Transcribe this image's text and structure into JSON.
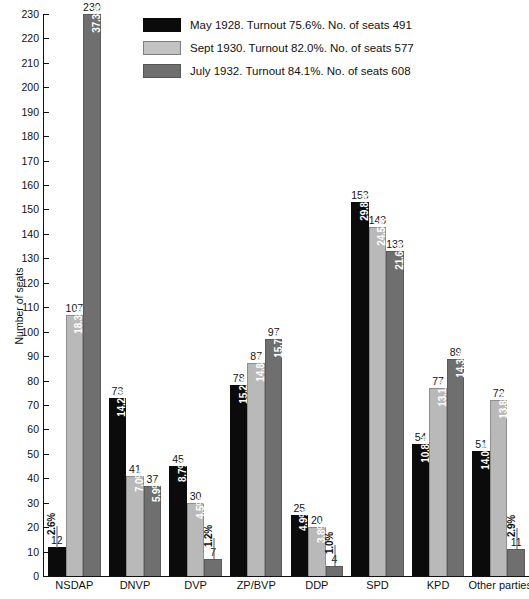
{
  "chart_data": {
    "type": "bar",
    "title": "",
    "xlabel": "",
    "ylabel": "Number of seats",
    "ylim": [
      0,
      230
    ],
    "ytick_step": 10,
    "grid": false,
    "legend_position": "top-center",
    "categories": [
      "NSDAP",
      "DNVP",
      "DVP",
      "ZP/BVP",
      "DDP",
      "SPD",
      "KPD",
      "Other parties"
    ],
    "series": [
      {
        "name": "May 1928. Turnout 75.6%. No. of seats 491",
        "short_name": "May 1928",
        "turnout": "75.6%",
        "total_seats": 491,
        "color": "#0b0b0b",
        "values": [
          12,
          73,
          45,
          78,
          25,
          153,
          54,
          51
        ],
        "percents": [
          "2.6%",
          "14.2%",
          "8.7%",
          "15.2%",
          "4.9%",
          "29.8%",
          "10.8%",
          "14.0%"
        ]
      },
      {
        "name": "Sept 1930. Turnout 82.0%. No. of seats 577",
        "short_name": "Sept 1930",
        "turnout": "82.0%",
        "total_seats": 577,
        "color": "#b9b9b9",
        "values": [
          107,
          41,
          30,
          87,
          20,
          143,
          77,
          72
        ],
        "percents": [
          "18.3%",
          "7.0%",
          "4.5%",
          "14.8%",
          "3.8%",
          "24.5%",
          "13.1%",
          "13.8%"
        ]
      },
      {
        "name": "July 1932. Turnout 84.1%. No. of seats 608",
        "short_name": "July 1932",
        "turnout": "84.1%",
        "total_seats": 608,
        "color": "#6f6f6f",
        "values": [
          230,
          37,
          7,
          97,
          4,
          133,
          89,
          11
        ],
        "percents": [
          "37.3%",
          "5.9%",
          "1.2%",
          "15.7%",
          "1.0%",
          "21.6%",
          "14.3%",
          "2.9%"
        ]
      }
    ],
    "ytick_labels": [
      "0",
      "10",
      "20",
      "30",
      "40",
      "50",
      "60",
      "70",
      "80",
      "90",
      "100",
      "110",
      "120",
      "130",
      "140",
      "150",
      "160",
      "170",
      "180",
      "190",
      "200",
      "210",
      "220",
      "230"
    ]
  },
  "legend": {
    "items": [
      {
        "label": "May 1928. Turnout 75.6%. No. of seats 491",
        "swatch": "series-1-swatch"
      },
      {
        "label": "Sept 1930. Turnout 82.0%. No. of seats 577",
        "swatch": "series-2-swatch"
      },
      {
        "label": "July 1932. Turnout 84.1%. No. of seats 608",
        "swatch": "series-3-swatch"
      }
    ]
  },
  "axis": {
    "y_title": "Number of seats"
  }
}
